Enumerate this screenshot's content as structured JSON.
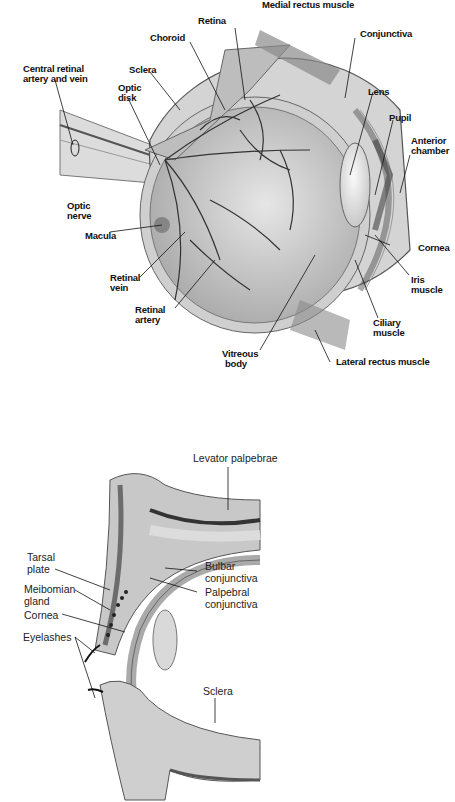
{
  "figures": [
    {
      "id": "eyeball-cross-section",
      "title": "Cross-section of the eyeball",
      "labels": {
        "medial_rectus": "Medial rectus muscle",
        "retina": "Retina",
        "choroid": "Choroid",
        "conjunctiva": "Conjunctiva",
        "central_retinal_1": "Central retinal",
        "central_retinal_2": "artery and vein",
        "sclera": "Sclera",
        "optic_disk_1": "Optic",
        "optic_disk_2": "disk",
        "lens": "Lens",
        "pupil": "Pupil",
        "anterior_chamber_1": "Anterior",
        "anterior_chamber_2": "chamber",
        "optic_nerve_1": "Optic",
        "optic_nerve_2": "nerve",
        "macula": "Macula",
        "cornea": "Cornea",
        "retinal_vein_1": "Retinal",
        "retinal_vein_2": "vein",
        "iris_muscle_1": "Iris",
        "iris_muscle_2": "muscle",
        "retinal_artery_1": "Retinal",
        "retinal_artery_2": "artery",
        "ciliary_muscle_1": "Ciliary",
        "ciliary_muscle_2": "muscle",
        "vitreous_body_1": "Vitreous",
        "vitreous_body_2": "body",
        "lateral_rectus": "Lateral rectus muscle"
      }
    },
    {
      "id": "eyelid-cross-section",
      "title": "Cross-section of the eyelids",
      "labels": {
        "levator": "Levator palpebrae",
        "tarsal_1": "Tarsal",
        "tarsal_2": "plate",
        "bulbar_1": "Bulbar",
        "bulbar_2": "conjunctiva",
        "meibomian_1": "Meibomian",
        "meibomian_2": "gland",
        "palpebral_1": "Palpebral",
        "palpebral_2": "conjunctiva",
        "cornea": "Cornea",
        "eyelashes": "Eyelashes",
        "sclera": "Sclera"
      }
    }
  ],
  "colors": {
    "background": "#ffffff",
    "ink": "#111111",
    "tissue_light": "#e2e2e2",
    "tissue_mid": "#b8b8b8",
    "tissue_dark": "#6a6a6a"
  }
}
